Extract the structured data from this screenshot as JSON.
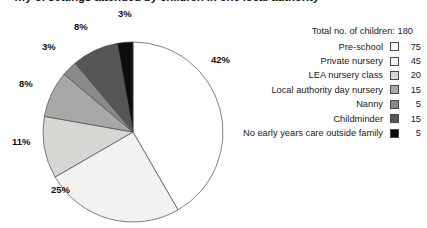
{
  "title": "…y of settings attended by children in one local authority",
  "legend": {
    "total_label": "Total no. of children: 180",
    "rows": [
      {
        "label": "Pre-school",
        "value": "75",
        "color": "#ffffff"
      },
      {
        "label": "Private nursery",
        "value": "45",
        "color": "#f2f2f0"
      },
      {
        "label": "LEA nursery class",
        "value": "20",
        "color": "#d6d6d2"
      },
      {
        "label": "Local authority day nursery",
        "value": "15",
        "color": "#a8a8a6"
      },
      {
        "label": "Nanny",
        "value": "5",
        "color": "#8a8a88"
      },
      {
        "label": "Childminder",
        "value": "15",
        "color": "#565656"
      },
      {
        "label": "No early years care outside family",
        "value": "5",
        "color": "#0d0d0d"
      }
    ]
  },
  "chart_data": {
    "type": "pie",
    "title": "…y of settings attended by children in one local authority",
    "total": 180,
    "total_label": "Total no. of children: 180",
    "legend_position": "right",
    "start_angle_deg": 0,
    "direction": "clockwise",
    "categories": [
      "Pre-school",
      "Private nursery",
      "LEA nursery class",
      "Local authority day nursery",
      "Nanny",
      "Childminder",
      "No early years care outside family"
    ],
    "values": [
      75,
      45,
      20,
      15,
      5,
      15,
      5
    ],
    "percent_labels": [
      "42%",
      "25%",
      "11%",
      "8%",
      "3%",
      "8%",
      "3%"
    ],
    "percentages": [
      42,
      25,
      11,
      8,
      3,
      8,
      3
    ],
    "colors": [
      "#ffffff",
      "#f2f2f0",
      "#d6d6d2",
      "#a8a8a6",
      "#8a8a88",
      "#565656",
      "#0d0d0d"
    ],
    "slice_label_positions": [
      {
        "label": "42%",
        "x": 211,
        "y": 54
      },
      {
        "label": "25%",
        "x": 51,
        "y": 184
      },
      {
        "label": "11%",
        "x": 12,
        "y": 136
      },
      {
        "label": "8%",
        "x": 19,
        "y": 78
      },
      {
        "label": "3%",
        "x": 42,
        "y": 41
      },
      {
        "label": "8%",
        "x": 74,
        "y": 21
      },
      {
        "label": "3%",
        "x": 118,
        "y": 8
      }
    ]
  }
}
